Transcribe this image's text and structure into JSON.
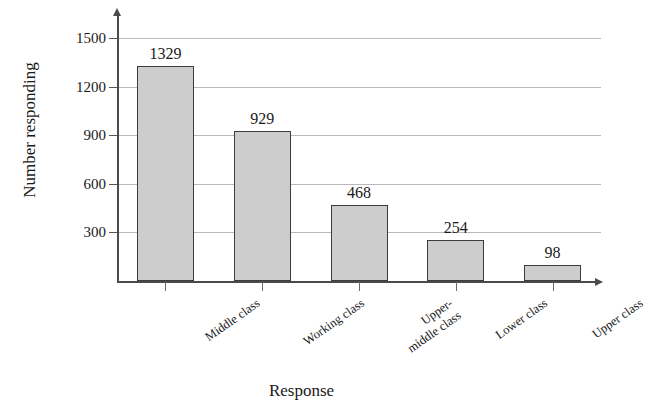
{
  "chart_data": {
    "type": "bar",
    "title": "",
    "xlabel": "Response",
    "ylabel": "Number responding",
    "categories": [
      "Middle class",
      "Working class",
      "Upper-\nmiddle class",
      "Lower class",
      "Upper class"
    ],
    "category_lines": [
      [
        "Middle class"
      ],
      [
        "Working class"
      ],
      [
        "Upper-",
        "middle class"
      ],
      [
        "Lower class"
      ],
      [
        "Upper class"
      ]
    ],
    "values": [
      1329,
      929,
      468,
      254,
      98
    ],
    "value_labels": [
      "1329",
      "929",
      "468",
      "254",
      "98"
    ],
    "yticks": [
      300,
      600,
      900,
      1200,
      1500
    ],
    "ytick_labels": [
      "300",
      "600",
      "900",
      "1200",
      "1500"
    ],
    "ylim": [
      0,
      1650
    ],
    "grid": true,
    "legend": "none",
    "bar_fill_color": "#cdcdcd",
    "bar_border_color": "#3c3c3c",
    "axis_color": "#4a4a4a",
    "grid_color": "#b9b9b9"
  }
}
